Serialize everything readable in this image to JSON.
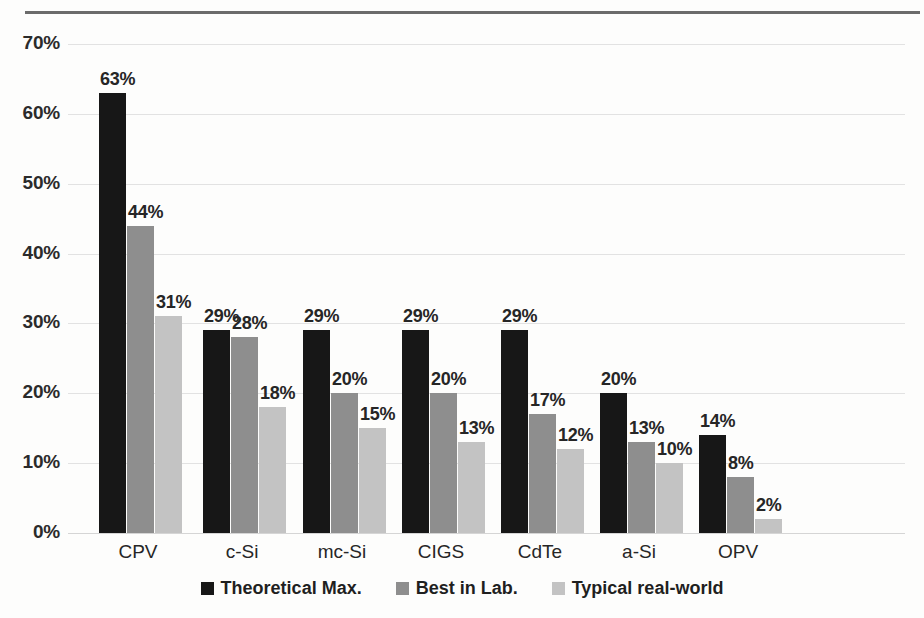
{
  "chart_data": {
    "type": "bar",
    "title": "",
    "xlabel": "",
    "ylabel": "",
    "ylim": [
      0,
      70
    ],
    "ytick_labels": [
      "0%",
      "10%",
      "20%",
      "30%",
      "40%",
      "50%",
      "60%",
      "70%"
    ],
    "ytick_values": [
      0,
      10,
      20,
      30,
      40,
      50,
      60,
      70
    ],
    "grid": true,
    "legend_position": "bottom",
    "categories": [
      "CPV",
      "c-Si",
      "mc-Si",
      "CIGS",
      "CdTe",
      "a-Si",
      "OPV"
    ],
    "series": [
      {
        "name": "Theoretical Max.",
        "color": "#171717",
        "values": [
          63,
          29,
          29,
          29,
          29,
          20,
          14
        ],
        "labels": [
          "63%",
          "29%",
          "29%",
          "29%",
          "29%",
          "20%",
          "14%"
        ]
      },
      {
        "name": "Best in Lab.",
        "color": "#8e8e8e",
        "values": [
          44,
          28,
          20,
          20,
          17,
          13,
          8
        ],
        "labels": [
          "44%",
          "28%",
          "20%",
          "20%",
          "17%",
          "13%",
          "8%"
        ]
      },
      {
        "name": "Typical real-world",
        "color": "#c3c3c3",
        "values": [
          31,
          18,
          15,
          13,
          12,
          10,
          2
        ],
        "labels": [
          "31%",
          "18%",
          "15%",
          "13%",
          "12%",
          "10%",
          "2%"
        ]
      }
    ]
  },
  "legend": {
    "items": [
      {
        "label": "Theoretical Max."
      },
      {
        "label": "Best in Lab."
      },
      {
        "label": "Typical real-world"
      }
    ]
  }
}
